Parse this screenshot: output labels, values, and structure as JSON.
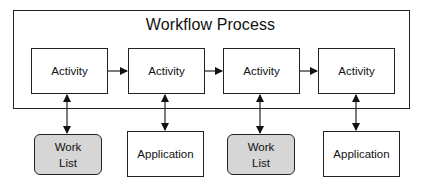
{
  "diagram": {
    "title": "Workflow Process",
    "activities": [
      {
        "label": "Activity"
      },
      {
        "label": "Activity"
      },
      {
        "label": "Activity"
      },
      {
        "label": "Activity"
      }
    ],
    "endpoints": [
      {
        "type": "worklist",
        "line1": "Work",
        "line2": "List"
      },
      {
        "type": "application",
        "label": "Application"
      },
      {
        "type": "worklist",
        "line1": "Work",
        "line2": "List"
      },
      {
        "type": "application",
        "label": "Application"
      }
    ],
    "connections": {
      "sequence": [
        "activity-1 -> activity-2",
        "activity-2 -> activity-3",
        "activity-3 -> activity-4"
      ],
      "bidirectional": [
        "activity-1 <-> worklist-1",
        "activity-2 <-> application-1",
        "activity-3 <-> worklist-2",
        "activity-4 <-> application-2"
      ]
    },
    "colors": {
      "stroke": "#222222",
      "worklist_fill": "#d6d6d6",
      "box_fill": "#ffffff"
    }
  }
}
